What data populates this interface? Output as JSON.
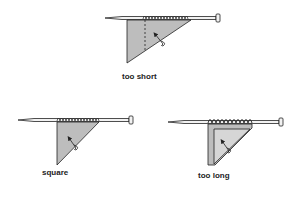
{
  "figure": {
    "panels": [
      {
        "id": "too-short",
        "label": "too short"
      },
      {
        "id": "square",
        "label": "square"
      },
      {
        "id": "too-long",
        "label": "too long"
      }
    ],
    "colors": {
      "swatch_fill": "#bdbdbd",
      "swatch_inner": "#d6d6d6",
      "outline": "#222222",
      "needle": "#f2f2f2"
    }
  }
}
